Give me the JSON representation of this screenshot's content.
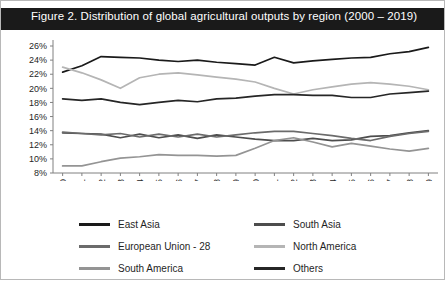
{
  "figure": {
    "title": "Figure 2.  Distribution of global agricultural outputs by region (2000 – 2019)",
    "title_bg": "#1a1a1a",
    "title_color": "#ffffff",
    "border_color": "#b8b8b8"
  },
  "legend": {
    "position": "bottom",
    "items": [
      {
        "label": "East Asia",
        "color": "#1a1a1a"
      },
      {
        "label": "South Asia",
        "color": "#4d4d4d"
      },
      {
        "label": "European Union - 28",
        "color": "#6b6b6b"
      },
      {
        "label": "North America",
        "color": "#b5b5b5"
      },
      {
        "label": "South America",
        "color": "#949494"
      },
      {
        "label": "Others",
        "color": "#262626"
      }
    ]
  },
  "chart_data": {
    "type": "line",
    "title": "Figure 2.  Distribution of global agricultural outputs by region (2000 – 2019)",
    "xlabel": "",
    "ylabel": "",
    "grid": false,
    "legend_position": "bottom",
    "ylim": [
      8,
      26
    ],
    "yticks": [
      8,
      10,
      12,
      14,
      16,
      18,
      20,
      22,
      24,
      26
    ],
    "ytick_labels": [
      "8%",
      "10%",
      "12%",
      "14%",
      "16%",
      "18%",
      "20%",
      "22%",
      "24%",
      "26%"
    ],
    "categories": [
      "2000",
      "2001",
      "2002",
      "2003",
      "2004",
      "2005",
      "2006",
      "2007",
      "2008",
      "2009",
      "2010",
      "2011",
      "2012",
      "2013",
      "2014",
      "2015",
      "2016",
      "2017",
      "2018",
      "2019"
    ],
    "series": [
      {
        "name": "East Asia",
        "color": "#1a1a1a",
        "values": [
          22.3,
          23.2,
          24.5,
          24.4,
          24.3,
          24.0,
          23.8,
          24.0,
          23.7,
          23.5,
          23.3,
          24.4,
          23.6,
          23.9,
          24.1,
          24.3,
          24.4,
          24.9,
          25.2,
          25.8
        ]
      },
      {
        "name": "South Asia",
        "color": "#4d4d4d",
        "values": [
          13.7,
          13.6,
          13.5,
          13.0,
          13.5,
          13.0,
          13.4,
          12.9,
          13.4,
          13.1,
          12.8,
          12.6,
          12.6,
          12.9,
          12.6,
          12.7,
          13.2,
          13.3,
          13.7,
          14.0
        ]
      },
      {
        "name": "European Union - 28",
        "color": "#6b6b6b",
        "values": [
          13.8,
          13.6,
          13.4,
          13.6,
          13.1,
          13.5,
          13.1,
          13.5,
          13.1,
          13.4,
          13.7,
          13.9,
          13.9,
          13.6,
          13.3,
          12.9,
          12.6,
          13.2,
          13.6,
          13.9
        ]
      },
      {
        "name": "North America",
        "color": "#b5b5b5",
        "values": [
          23.0,
          22.2,
          21.2,
          20.0,
          21.5,
          22.0,
          22.2,
          21.9,
          21.6,
          21.3,
          20.9,
          20.0,
          19.2,
          19.8,
          20.2,
          20.6,
          20.8,
          20.6,
          20.3,
          19.8
        ]
      },
      {
        "name": "South America",
        "color": "#949494",
        "values": [
          9.0,
          9.0,
          9.6,
          10.1,
          10.3,
          10.6,
          10.5,
          10.5,
          10.4,
          10.5,
          11.5,
          12.6,
          13.0,
          12.4,
          11.7,
          12.2,
          11.8,
          11.4,
          11.1,
          11.5
        ]
      },
      {
        "name": "Others",
        "color": "#262626",
        "values": [
          18.5,
          18.3,
          18.5,
          18.0,
          17.7,
          18.0,
          18.3,
          18.1,
          18.5,
          18.6,
          18.9,
          19.1,
          19.1,
          19.0,
          19.0,
          18.7,
          18.7,
          19.2,
          19.4,
          19.6
        ]
      }
    ]
  }
}
